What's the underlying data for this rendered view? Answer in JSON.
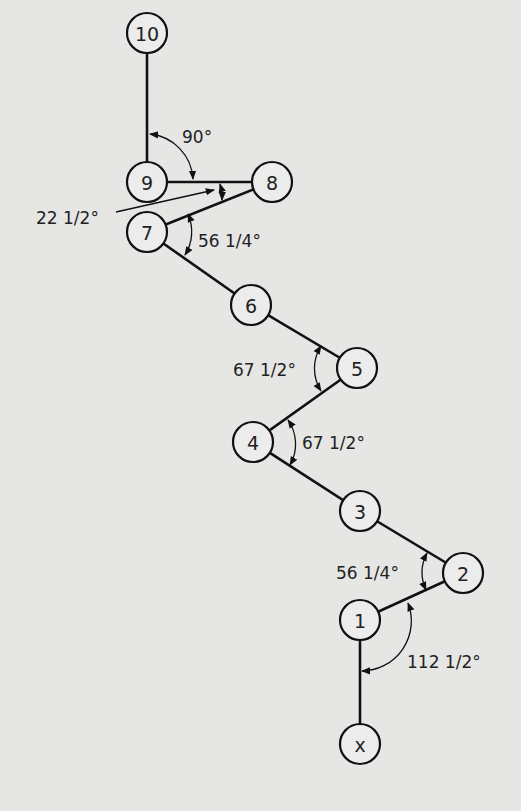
{
  "diagram": {
    "title": "",
    "background": "#e6e6e4",
    "nodes": [
      {
        "id": "10",
        "label": "10",
        "x": 147,
        "y": 33
      },
      {
        "id": "9",
        "label": "9",
        "x": 147,
        "y": 182
      },
      {
        "id": "8",
        "label": "8",
        "x": 272,
        "y": 182
      },
      {
        "id": "7",
        "label": "7",
        "x": 147,
        "y": 232
      },
      {
        "id": "6",
        "label": "6",
        "x": 251,
        "y": 305
      },
      {
        "id": "5",
        "label": "5",
        "x": 357,
        "y": 368
      },
      {
        "id": "4",
        "label": "4",
        "x": 253,
        "y": 442
      },
      {
        "id": "3",
        "label": "3",
        "x": 360,
        "y": 511
      },
      {
        "id": "2",
        "label": "2",
        "x": 463,
        "y": 573
      },
      {
        "id": "1",
        "label": "1",
        "x": 360,
        "y": 620
      },
      {
        "id": "x",
        "label": "x",
        "x": 360,
        "y": 744
      }
    ],
    "edges": [
      [
        "x",
        "1"
      ],
      [
        "1",
        "2"
      ],
      [
        "2",
        "3"
      ],
      [
        "3",
        "4"
      ],
      [
        "4",
        "5"
      ],
      [
        "5",
        "6"
      ],
      [
        "6",
        "7"
      ],
      [
        "7",
        "8"
      ],
      [
        "8",
        "9"
      ],
      [
        "9",
        "10"
      ]
    ],
    "angles": [
      {
        "at": "9",
        "between": [
          "10",
          "8"
        ],
        "label": "90°"
      },
      {
        "at": "8",
        "between": [
          "9",
          "7"
        ],
        "label": "22 1/2°"
      },
      {
        "at": "7",
        "between": [
          "8",
          "6"
        ],
        "label": "56 1/4°"
      },
      {
        "at": "5",
        "between": [
          "6",
          "4"
        ],
        "label": "67 1/2°"
      },
      {
        "at": "4",
        "between": [
          "5",
          "3"
        ],
        "label": "67 1/2°"
      },
      {
        "at": "2",
        "between": [
          "3",
          "1"
        ],
        "label": "56 1/4°"
      },
      {
        "at": "1",
        "between": [
          "2",
          "x"
        ],
        "label": "112 1/2°"
      }
    ]
  }
}
